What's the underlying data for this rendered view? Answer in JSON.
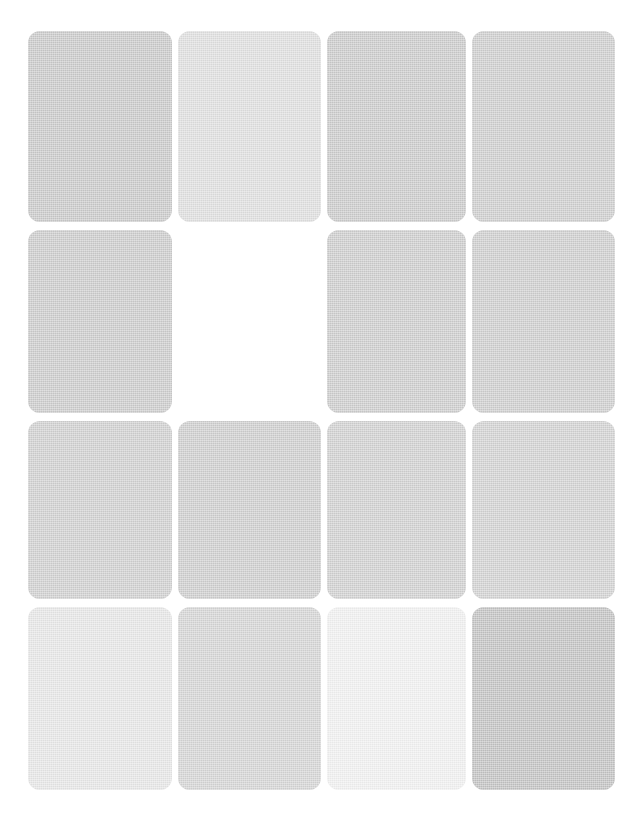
{
  "page": {
    "background_color": "#ffffff",
    "width": 642,
    "height": 836
  },
  "grid": {
    "columns": 4,
    "rows": 4,
    "column_gap": 6,
    "row_gap": 8,
    "card_corner_radius": 12,
    "margin_left": 28,
    "margin_top": 31,
    "total_slots": 16,
    "filled_slots": 15,
    "empty_slots": 1
  },
  "cards": [
    {
      "id": "card-r1c1",
      "row": 1,
      "col": 1,
      "label": "",
      "state": "filled",
      "color": "#c9c9c9"
    },
    {
      "id": "card-r1c2",
      "row": 1,
      "col": 2,
      "label": "",
      "state": "filled",
      "color": "#dedede"
    },
    {
      "id": "card-r1c3",
      "row": 1,
      "col": 3,
      "label": "",
      "state": "filled",
      "color": "#cacaca"
    },
    {
      "id": "card-r1c4",
      "row": 1,
      "col": 4,
      "label": "",
      "state": "filled",
      "color": "#cdcdcd"
    },
    {
      "id": "card-r2c1",
      "row": 2,
      "col": 1,
      "label": "",
      "state": "filled",
      "color": "#cbcbcb"
    },
    {
      "id": "card-r2c2",
      "row": 2,
      "col": 2,
      "label": "",
      "state": "empty",
      "color": "#ffffff"
    },
    {
      "id": "card-r2c3",
      "row": 2,
      "col": 3,
      "label": "",
      "state": "filled",
      "color": "#cccccc"
    },
    {
      "id": "card-r2c4",
      "row": 2,
      "col": 4,
      "label": "",
      "state": "filled",
      "color": "#cdcdcd"
    },
    {
      "id": "card-r3c1",
      "row": 3,
      "col": 1,
      "label": "",
      "state": "filled",
      "color": "#cfcfcf"
    },
    {
      "id": "card-r3c2",
      "row": 3,
      "col": 2,
      "label": "",
      "state": "filled",
      "color": "#cdcdcd"
    },
    {
      "id": "card-r3c3",
      "row": 3,
      "col": 3,
      "label": "",
      "state": "filled",
      "color": "#d0d0d0"
    },
    {
      "id": "card-r3c4",
      "row": 3,
      "col": 4,
      "label": "",
      "state": "filled",
      "color": "#d1d1d1"
    },
    {
      "id": "card-r4c1",
      "row": 4,
      "col": 1,
      "label": "",
      "state": "filled",
      "color": "#e6e6e6"
    },
    {
      "id": "card-r4c2",
      "row": 4,
      "col": 2,
      "label": "",
      "state": "filled",
      "color": "#d4d4d4"
    },
    {
      "id": "card-r4c3",
      "row": 4,
      "col": 3,
      "label": "",
      "state": "filled",
      "color": "#f0f0f0"
    },
    {
      "id": "card-r4c4",
      "row": 4,
      "col": 4,
      "label": "",
      "state": "filled",
      "color": "#c2c2c2"
    }
  ]
}
